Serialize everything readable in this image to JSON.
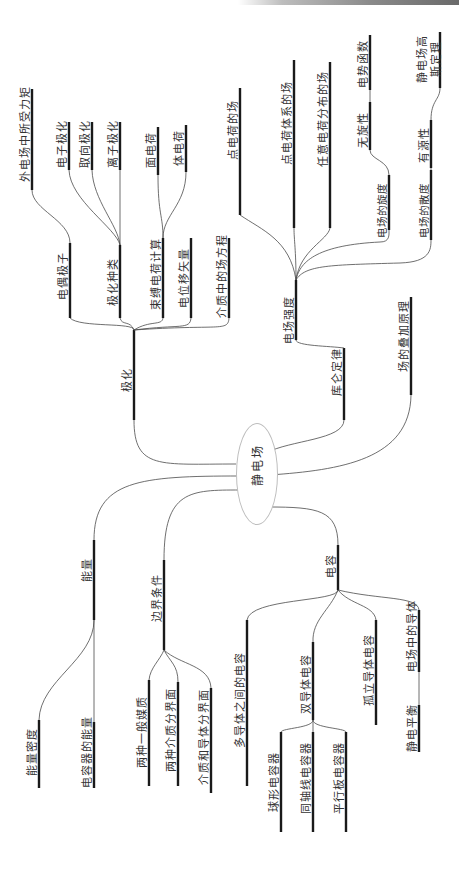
{
  "mindmap": {
    "root": "静电场",
    "branches": {
      "polarization": {
        "label": "极化",
        "children": {
          "dipole": "电偶极子",
          "dipole_torque": "外电场中所受力矩",
          "kinds": "极化种类",
          "electronic": "电子极化",
          "orientation": "取向极化",
          "ionic": "离子极化",
          "bound_charge": "束缚电荷计算",
          "surface_charge": "面电荷",
          "volume_charge": "体电荷",
          "displacement": "电位移矢量",
          "field_eq_in_dielectric": "介质中的场方程"
        }
      },
      "coulomb": {
        "label": "库仑定律",
        "field_strength": {
          "label": "电场强度",
          "children": {
            "point_charge": "点电荷的场",
            "point_system": "点电荷体系的场",
            "arbitrary": "任意电荷分布的场",
            "curl": "电场的旋度",
            "irrotational": "无旋性",
            "potential_fn": "电势函数",
            "divergence": "电场的散度",
            "sourced": "有源性",
            "gauss": "静电场高斯定理"
          }
        }
      },
      "superposition": {
        "label": "场的叠加原理"
      },
      "energy": {
        "label": "能量",
        "children": {
          "density": "能量密度",
          "capacitor_energy": "电容器的能量"
        }
      },
      "boundary": {
        "label": "边界条件",
        "children": {
          "two_general": "两种一般媒质",
          "two_dielectric": "两种介质分界面",
          "dielectric_conductor": "介质和导体分界面"
        }
      },
      "capacitance": {
        "label": "电容",
        "children": {
          "multi_conductor": "多导体之间的电容",
          "two_conductor": "双导体电容",
          "spherical": "球形电容器",
          "coaxial": "同轴线电容器",
          "parallel_plate": "平行板电容器",
          "isolated": "孤立导体电容",
          "conductor_in_field": "电场中的导体",
          "equilibrium": "静电平衡"
        }
      }
    }
  }
}
